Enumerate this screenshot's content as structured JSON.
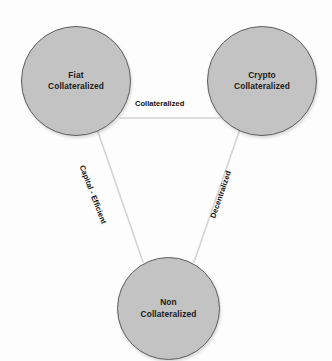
{
  "diagram": {
    "type": "triangle-relationship-diagram",
    "background_color": "#fdfdfd",
    "node_fill_color": "#c3c3c3",
    "node_stroke_color": "#5e5e5e",
    "edge_color": "#d2d2d2",
    "label_color": "#111111",
    "nodes": [
      {
        "id": "fiat",
        "label": "Fiat\nCollateralized",
        "line1": "Fiat",
        "line2": "Collateralized",
        "cx": 76,
        "cy": 81,
        "r": 55
      },
      {
        "id": "crypto",
        "label": "Crypto\nCollateralized",
        "line1": "Crypto",
        "line2": "Collateralized",
        "cx": 262,
        "cy": 81,
        "r": 55
      },
      {
        "id": "non",
        "label": "Non\nCollateralized",
        "line1": "Non",
        "line2": "Collateralized",
        "cx": 168,
        "cy": 308,
        "r": 51
      }
    ],
    "edges": [
      {
        "id": "fiat-crypto",
        "label": "Collateralized",
        "from": "fiat",
        "to": "crypto",
        "orientation": "horizontal",
        "rotation_deg": 0
      },
      {
        "id": "fiat-non",
        "label": "Capital - Efficient",
        "from": "fiat",
        "to": "non",
        "orientation": "diagonal-left",
        "rotation_deg": 69
      },
      {
        "id": "crypto-non",
        "label": "Decentralized",
        "from": "crypto",
        "to": "non",
        "orientation": "diagonal-right",
        "rotation_deg": -71
      }
    ]
  }
}
